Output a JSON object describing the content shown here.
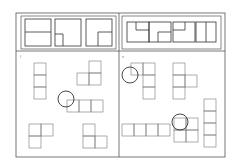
{
  "figure": {
    "stroke_color": "#555555",
    "circle_color": "#333333",
    "outer_frame": {
      "x": 16,
      "y": 13,
      "w": 209,
      "h": 144
    },
    "divider_x": 119,
    "top_band_bottom": 51,
    "panels": [
      {
        "id": "left",
        "label": "f",
        "label_pos": {
          "x": 20,
          "y": 54
        },
        "top_box": {
          "x": 21,
          "y": 16,
          "w": 95,
          "h": 33
        },
        "top_items": [
          {
            "x": 25,
            "y": 19,
            "w": 26,
            "h": 27,
            "lines": [
              [
                25,
                32,
                51,
                32
              ]
            ]
          },
          {
            "x": 55,
            "y": 19,
            "w": 26,
            "h": 27,
            "lines": [
              [
                55,
                34,
                63,
                34
              ],
              [
                63,
                34,
                63,
                46
              ]
            ]
          },
          {
            "x": 86,
            "y": 19,
            "w": 26,
            "h": 27,
            "lines": [
              [
                98,
                32,
                112,
                32
              ],
              [
                98,
                32,
                98,
                46
              ]
            ]
          }
        ],
        "shapes": [
          {
            "name": "vertical-3",
            "cells": [
              [
                34,
                63
              ],
              [
                34,
                75
              ],
              [
                34,
                87
              ]
            ],
            "size": 12
          },
          {
            "name": "L-corner",
            "cells": [
              [
                89,
                61
              ],
              [
                77,
                73
              ],
              [
                89,
                73
              ]
            ],
            "size": 12
          },
          {
            "name": "horizontal-3",
            "cells": [
              [
                67,
                100
              ],
              [
                79,
                100
              ],
              [
                91,
                100
              ]
            ],
            "size": 12
          },
          {
            "name": "L-left",
            "cells": [
              [
                29,
                124
              ],
              [
                41,
                124
              ],
              [
                29,
                136
              ]
            ],
            "size": 12
          },
          {
            "name": "L-right",
            "cells": [
              [
                83,
                124
              ],
              [
                83,
                136
              ],
              [
                95,
                136
              ]
            ],
            "size": 12
          }
        ],
        "circles": [
          {
            "cx": 66,
            "cy": 99,
            "r": 8
          }
        ]
      },
      {
        "id": "right",
        "label": "e",
        "label_pos": {
          "x": 122,
          "y": 54
        },
        "top_box": {
          "x": 122,
          "y": 16,
          "w": 99,
          "h": 33
        },
        "top_items": [
          {
            "x": 127,
            "y": 22,
            "w": 22,
            "h": 20,
            "lines": [
              [
                136,
                22,
                136,
                30
              ],
              [
                136,
                30,
                149,
                30
              ]
            ]
          },
          {
            "x": 149,
            "y": 22,
            "w": 22,
            "h": 20,
            "lines": [
              [
                158,
                32,
                158,
                42
              ],
              [
                158,
                32,
                171,
                32
              ]
            ]
          },
          {
            "x": 173,
            "y": 22,
            "w": 22,
            "h": 20,
            "lines": [
              [
                185,
                22,
                185,
                30
              ],
              [
                173,
                30,
                185,
                30
              ]
            ]
          },
          {
            "x": 196,
            "y": 22,
            "w": 20,
            "h": 20,
            "lines": [
              [
                206,
                22,
                206,
                42
              ]
            ]
          }
        ],
        "shapes": [
          {
            "name": "vertical-with-top-left",
            "cells": [
              [
                131,
                63
              ],
              [
                143,
                63
              ],
              [
                143,
                75
              ],
              [
                143,
                87
              ]
            ],
            "size": 12
          },
          {
            "name": "T-shape",
            "cells": [
              [
                173,
                63
              ],
              [
                173,
                75
              ],
              [
                185,
                75
              ],
              [
                173,
                87
              ]
            ],
            "size": 12
          },
          {
            "name": "horizontal-4",
            "cells": [
              [
                122,
                124
              ],
              [
                134,
                124
              ],
              [
                146,
                124
              ],
              [
                158,
                124
              ]
            ],
            "size": 12
          },
          {
            "name": "square-2x2",
            "cells": [
              [
                174,
                118
              ],
              [
                186,
                118
              ],
              [
                174,
                130
              ],
              [
                186,
                130
              ]
            ],
            "size": 12
          },
          {
            "name": "vertical-4",
            "cells": [
              [
                204,
                99
              ],
              [
                204,
                111
              ],
              [
                204,
                123
              ],
              [
                204,
                135
              ]
            ],
            "size": 12
          }
        ],
        "circles": [
          {
            "cx": 130,
            "cy": 75,
            "r": 8
          },
          {
            "cx": 180,
            "cy": 122,
            "r": 8
          }
        ]
      }
    ]
  }
}
